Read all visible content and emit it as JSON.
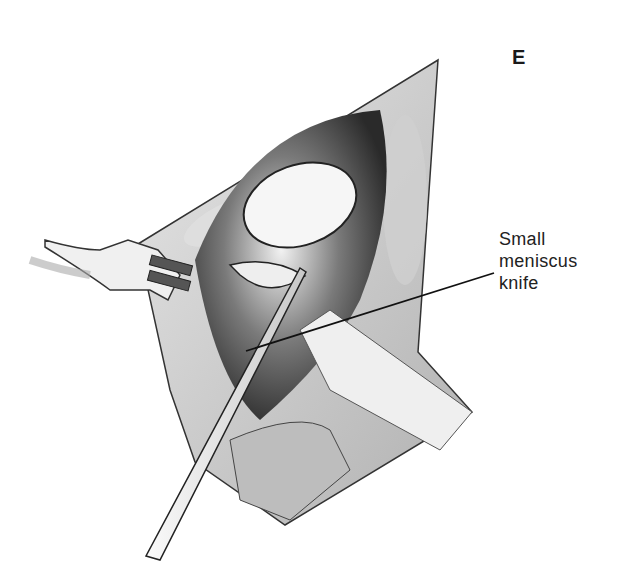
{
  "figure": {
    "panel_letter": "E",
    "callout": {
      "lines": [
        "Small",
        "meniscus",
        "knife"
      ]
    },
    "colors": {
      "ink": "#1a1a1a",
      "shadow": "#3a3a3a",
      "midtone": "#9a9a9a",
      "light": "#d8d8d8",
      "paper": "#ffffff"
    }
  }
}
